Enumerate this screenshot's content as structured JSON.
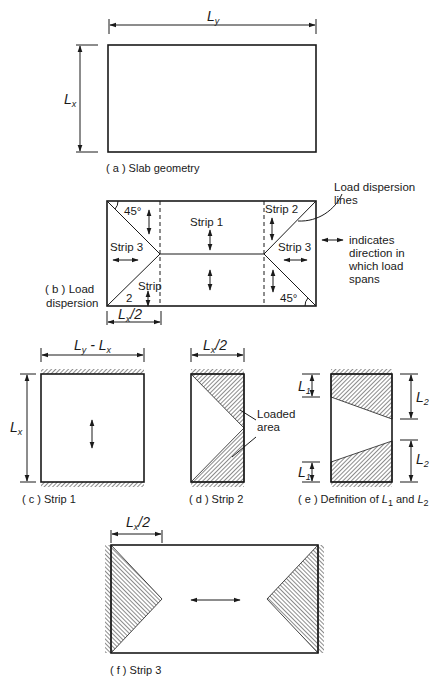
{
  "colors": {
    "ink": "#1a1a1a",
    "background": "#ffffff"
  },
  "panel_a": {
    "dim_top": {
      "symbol": "L",
      "sub": "y"
    },
    "dim_left": {
      "symbol": "L",
      "sub": "x"
    },
    "caption": "( a ) Slab geometry"
  },
  "panel_b": {
    "angle_top_left": "45°",
    "angle_bottom_right": "45°",
    "strip1": "Strip 1",
    "strip2_right": "Strip 2",
    "strip3_left": "Strip 3",
    "strip3_right": "Strip 3",
    "strip2_left_line1": "Strip",
    "strip2_left_line2": "2",
    "dim_bottom": {
      "symbol": "L",
      "sub": "x",
      "suffix": "/2"
    },
    "caption_line1": "( b ) Load",
    "caption_line2": "dispersion",
    "callout_line1": "Load dispersion",
    "callout_line2": "lines",
    "legend_line1": "indicates",
    "legend_line2": "direction in",
    "legend_line3": "which load",
    "legend_line4": "spans"
  },
  "panel_c": {
    "dim_top": {
      "a": "L",
      "a_sub": "y",
      "op": "-",
      "b": "L",
      "b_sub": "x"
    },
    "dim_left": {
      "symbol": "L",
      "sub": "x"
    },
    "caption": "( c ) Strip 1"
  },
  "panel_d": {
    "dim_top": {
      "symbol": "L",
      "sub": "x",
      "suffix": "/2"
    },
    "callout_line1": "Loaded",
    "callout_line2": "area",
    "caption": "( d ) Strip 2"
  },
  "panel_e": {
    "l1": {
      "symbol": "L",
      "sub": "1"
    },
    "l2": {
      "symbol": "L",
      "sub": "2"
    },
    "caption_pre": "( e ) Definition of ",
    "caption_l1": "L",
    "caption_l1_sub": "1",
    "caption_mid": " and ",
    "caption_l2": "L",
    "caption_l2_sub": "2"
  },
  "panel_f": {
    "dim_top": {
      "symbol": "L",
      "sub": "x",
      "suffix": "/2"
    },
    "caption": "( f ) Strip 3"
  }
}
